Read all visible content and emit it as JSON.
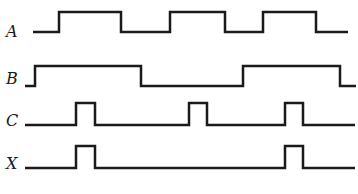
{
  "diagram": {
    "type": "timing-diagram",
    "stroke_color": "#1a1a1a",
    "background": "#ffffff",
    "signals": [
      {
        "name": "A",
        "label_pos": [
          6,
          24
        ],
        "low_y": 32,
        "high_y": 12,
        "points": [
          [
            33,
            32
          ],
          [
            59,
            32
          ],
          [
            59,
            12
          ],
          [
            121,
            12
          ],
          [
            121,
            32
          ],
          [
            170,
            32
          ],
          [
            170,
            12
          ],
          [
            225,
            12
          ],
          [
            225,
            32
          ],
          [
            263,
            32
          ],
          [
            263,
            12
          ],
          [
            316,
            12
          ],
          [
            316,
            32
          ],
          [
            348,
            32
          ]
        ]
      },
      {
        "name": "B",
        "label_pos": [
          6,
          71
        ],
        "low_y": 86,
        "high_y": 66,
        "points": [
          [
            25,
            86
          ],
          [
            35,
            86
          ],
          [
            35,
            66
          ],
          [
            141,
            66
          ],
          [
            141,
            86
          ],
          [
            243,
            86
          ],
          [
            243,
            66
          ],
          [
            340,
            66
          ],
          [
            340,
            86
          ],
          [
            356,
            86
          ]
        ]
      },
      {
        "name": "C",
        "label_pos": [
          6,
          113
        ],
        "low_y": 125,
        "high_y": 103,
        "points": [
          [
            25,
            125
          ],
          [
            76,
            125
          ],
          [
            76,
            103
          ],
          [
            95,
            103
          ],
          [
            95,
            125
          ],
          [
            189,
            125
          ],
          [
            189,
            103
          ],
          [
            207,
            103
          ],
          [
            207,
            125
          ],
          [
            285,
            125
          ],
          [
            285,
            103
          ],
          [
            303,
            103
          ],
          [
            303,
            125
          ],
          [
            355,
            125
          ]
        ]
      },
      {
        "name": "X",
        "label_pos": [
          6,
          156
        ],
        "low_y": 168,
        "high_y": 146,
        "points": [
          [
            25,
            168
          ],
          [
            76,
            168
          ],
          [
            76,
            146
          ],
          [
            95,
            146
          ],
          [
            95,
            168
          ],
          [
            285,
            168
          ],
          [
            285,
            146
          ],
          [
            303,
            146
          ],
          [
            303,
            168
          ],
          [
            355,
            168
          ]
        ]
      }
    ]
  }
}
